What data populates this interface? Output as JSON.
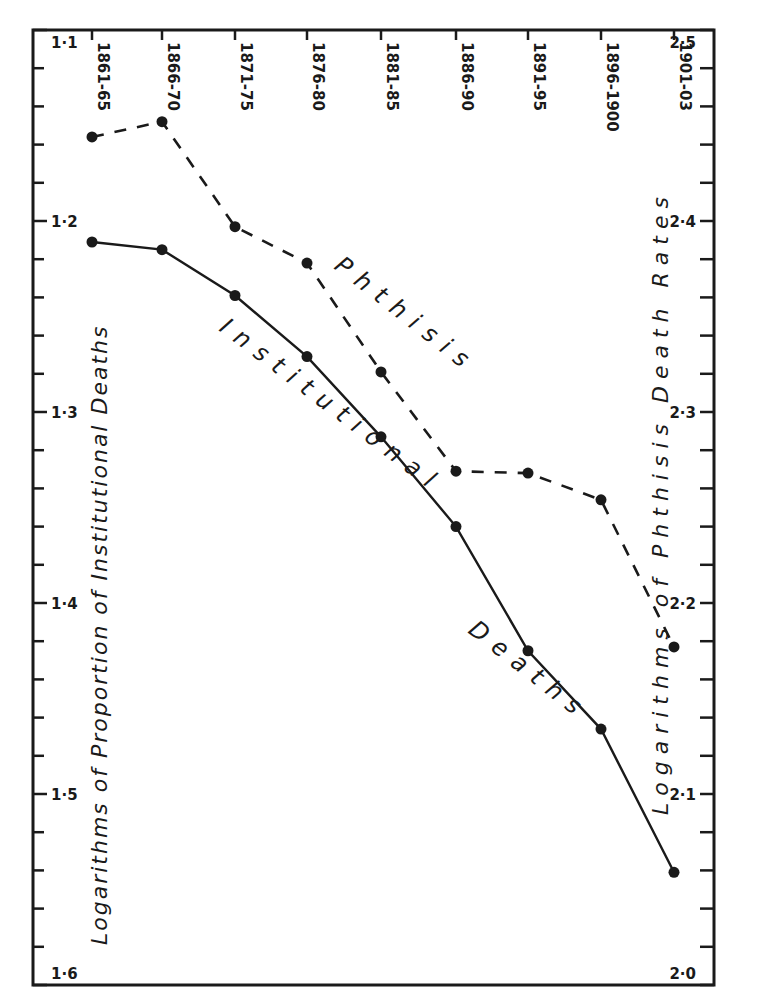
{
  "chart_data": {
    "type": "line",
    "title": "",
    "categories": [
      "1861-65",
      "1866-70",
      "1871-75",
      "1876-80",
      "1881-85",
      "1886-90",
      "1891-95",
      "1896-1900",
      "1901-03"
    ],
    "category_axis_position": "top",
    "series": [
      {
        "name": "Institutional Deaths",
        "axis": "left",
        "line_style": "solid",
        "values": [
          1.211,
          1.215,
          1.239,
          1.271,
          1.313,
          1.36,
          1.425,
          1.466,
          1.541
        ]
      },
      {
        "name": "Phthisis",
        "axis": "right",
        "line_style": "dashed",
        "values": [
          2.444,
          2.452,
          2.397,
          2.378,
          2.321,
          2.269,
          2.268,
          2.254,
          2.177
        ]
      }
    ],
    "left_axis": {
      "label": "Logarithms of Proportion of Institutional Deaths",
      "range": [
        1.1,
        1.6
      ],
      "inverted": true,
      "tick_labels": [
        "1·1",
        "1·2",
        "1·3",
        "1·4",
        "1·5",
        "1·6"
      ],
      "ticks": [
        1.1,
        1.2,
        1.3,
        1.4,
        1.5,
        1.6
      ],
      "minor_step": 0.02
    },
    "right_axis": {
      "label": "Logarithms of Phthisis Death Rates",
      "range": [
        2.0,
        2.5
      ],
      "tick_labels": [
        "2·5",
        "2·4",
        "2·3",
        "2·2",
        "2·1",
        "2·0"
      ],
      "ticks": [
        2.5,
        2.4,
        2.3,
        2.2,
        2.1,
        2.0
      ],
      "minor_step": 0.02
    },
    "annotations": [
      "Phthisis",
      "Institutional",
      "Deaths"
    ],
    "grid": false,
    "legend": "none (curves labeled inline)"
  },
  "labels": {
    "left_axis_title": "Logarithms of Proportion of Institutional Deaths",
    "right_axis_title": "Logarithms of Phthisis Death Rates",
    "curve_phthisis": "Phthisis",
    "curve_institutional_1": "Institutional",
    "curve_institutional_2": "Deaths"
  },
  "colors": {
    "ink": "#1a1a1a",
    "background": "#ffffff"
  }
}
